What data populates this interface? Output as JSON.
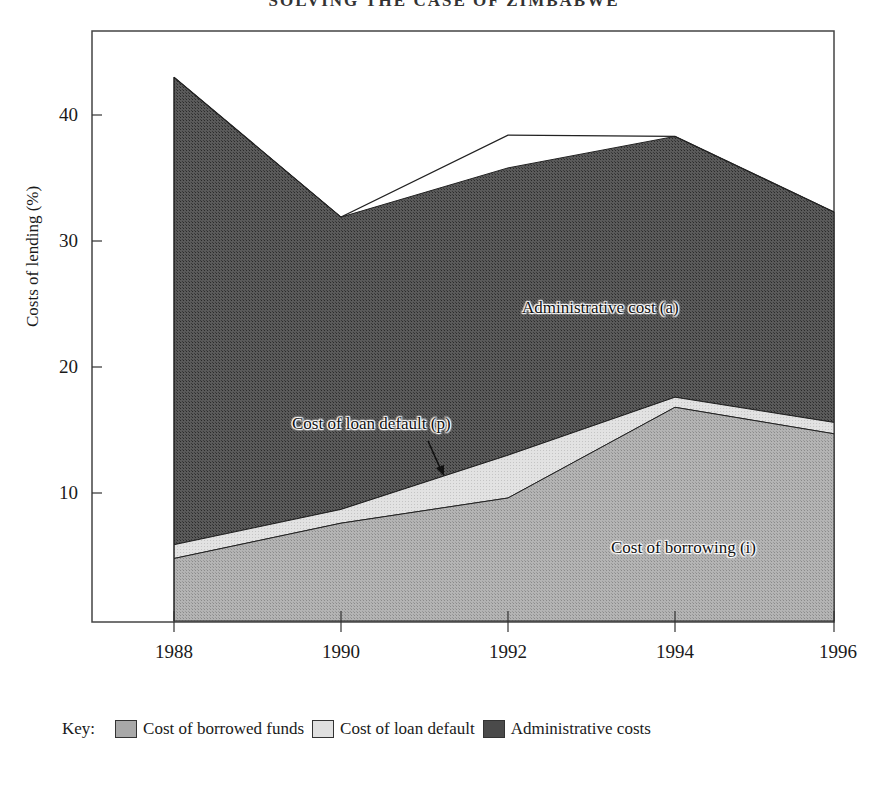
{
  "title": "SOLVING THE CASE OF ZIMBABWE",
  "chart_data": {
    "type": "area",
    "stacked": true,
    "title": "SOLVING THE CASE OF ZIMBABWE",
    "xlabel": "",
    "ylabel": "Costs of lending (%)",
    "x": [
      1988,
      1990,
      1992,
      1994,
      1996
    ],
    "x_ticks": [
      "1988",
      "1990",
      "1992",
      "1994",
      "1996"
    ],
    "y_ticks": [
      "10",
      "20",
      "30",
      "40"
    ],
    "ylim": [
      0,
      46
    ],
    "xlim": [
      1987,
      1996
    ],
    "grid": false,
    "series": [
      {
        "name": "Cost of borrowed funds",
        "values": [
          4.8,
          7.6,
          9.6,
          16.8,
          14.7
        ],
        "color": "#a8a8a8"
      },
      {
        "name": "Cost of loan default",
        "values": [
          1.1,
          1.1,
          3.4,
          0.8,
          0.9
        ],
        "color": "#dcdcdc"
      },
      {
        "name": "Administrative costs",
        "values": [
          37.1,
          23.2,
          22.8,
          20.7,
          16.7
        ],
        "color": "#4a4a4a"
      }
    ],
    "cumulative_tops": {
      "borrowing": [
        4.8,
        7.6,
        9.6,
        16.8,
        14.7
      ],
      "loan_default": [
        5.9,
        8.7,
        13.0,
        17.6,
        15.6
      ],
      "administrative": [
        43.0,
        31.9,
        35.8,
        38.3,
        32.3
      ]
    },
    "outline_line": {
      "values": [
        43.0,
        31.9,
        38.4,
        38.3,
        32.3
      ]
    },
    "annotations": [
      {
        "text": "Administrative cost (a)"
      },
      {
        "text": "Cost of loan default (p)",
        "arrow": true
      },
      {
        "text": "Cost of borrowing (i)"
      }
    ],
    "legend": {
      "position": "bottom",
      "prefix": "Key:"
    }
  },
  "axis": {
    "ylabel": "Costs of lending (%)",
    "y_ticks": [
      "40",
      "30",
      "20",
      "10"
    ],
    "x_ticks": [
      "1988",
      "1990",
      "1992",
      "1994",
      "1996"
    ]
  },
  "annotations": {
    "admin": "Administrative cost (a)",
    "default": "Cost of loan default (p)",
    "borrowing": "Cost of borrowing (i)"
  },
  "legend": {
    "prefix": "Key:",
    "items": [
      {
        "label": "Cost of borrowed funds",
        "color": "#a8a8a8"
      },
      {
        "label": "Cost of loan default",
        "color": "#dcdcdc"
      },
      {
        "label": "Administrative costs",
        "color": "#4a4a4a"
      }
    ]
  }
}
